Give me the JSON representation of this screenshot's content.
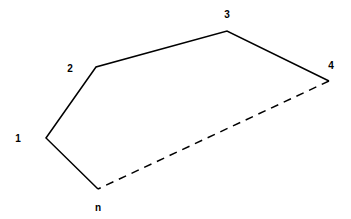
{
  "diagram": {
    "type": "polygon",
    "stroke_color": "#000000",
    "vertices": [
      {
        "label": "1",
        "x": 46,
        "y": 138,
        "lx": 18,
        "ly": 142
      },
      {
        "label": "2",
        "x": 96,
        "y": 67,
        "lx": 70,
        "ly": 72
      },
      {
        "label": "3",
        "x": 227,
        "y": 31,
        "lx": 227,
        "ly": 18
      },
      {
        "label": "4",
        "x": 329,
        "y": 81,
        "lx": 331,
        "ly": 69
      },
      {
        "label": "n",
        "x": 98,
        "y": 189,
        "lx": 98,
        "ly": 211
      }
    ],
    "solid_edges": [
      [
        "n",
        "1"
      ],
      [
        "1",
        "2"
      ],
      [
        "2",
        "3"
      ],
      [
        "3",
        "4"
      ]
    ],
    "dashed_edges": [
      [
        "4",
        "n"
      ]
    ]
  }
}
